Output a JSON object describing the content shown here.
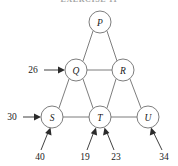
{
  "figure": {
    "caption": "EXERCISE 11",
    "type": "directed-flow-network-diagram"
  },
  "nodes": [
    {
      "id": "P",
      "label": "P",
      "cx": 100,
      "cy": 22,
      "r": 11
    },
    {
      "id": "Q",
      "label": "Q",
      "cx": 76,
      "cy": 70,
      "r": 11
    },
    {
      "id": "R",
      "label": "R",
      "cx": 123,
      "cy": 70,
      "r": 11
    },
    {
      "id": "S",
      "label": "S",
      "cx": 52,
      "cy": 117,
      "r": 11
    },
    {
      "id": "T",
      "label": "T",
      "cx": 100,
      "cy": 117,
      "r": 11
    },
    {
      "id": "U",
      "label": "U",
      "cx": 148,
      "cy": 117,
      "r": 11
    }
  ],
  "edges": [
    {
      "from": "P",
      "to": "Q"
    },
    {
      "from": "P",
      "to": "R"
    },
    {
      "from": "Q",
      "to": "R"
    },
    {
      "from": "Q",
      "to": "S"
    },
    {
      "from": "Q",
      "to": "T"
    },
    {
      "from": "R",
      "to": "T"
    },
    {
      "from": "R",
      "to": "U"
    },
    {
      "from": "S",
      "to": "T"
    },
    {
      "from": "T",
      "to": "U"
    }
  ],
  "inflow_arrows": [
    {
      "id": "in-26",
      "value": "26",
      "target": "Q",
      "direction": "from-left",
      "label_x": 33,
      "label_y": 70,
      "x1": 44,
      "y1": 70,
      "x2": 64,
      "y2": 70
    },
    {
      "id": "in-30",
      "value": "30",
      "target": "S",
      "direction": "from-left",
      "label_x": 12,
      "label_y": 117,
      "x1": 23,
      "y1": 117,
      "x2": 40,
      "y2": 117
    },
    {
      "id": "in-40",
      "value": "40",
      "target": "S",
      "direction": "from-below",
      "label_x": 40,
      "label_y": 157,
      "x1": 42,
      "y1": 150,
      "x2": 50,
      "y2": 130
    },
    {
      "id": "in-19",
      "value": "19",
      "target": "T",
      "direction": "from-below",
      "label_x": 85,
      "label_y": 157,
      "x1": 88,
      "y1": 150,
      "x2": 95,
      "y2": 130
    },
    {
      "id": "in-23",
      "value": "23",
      "target": "T",
      "direction": "from-below",
      "label_x": 116,
      "label_y": 157,
      "x1": 113,
      "y1": 150,
      "x2": 105,
      "y2": 130
    },
    {
      "id": "in-34",
      "value": "34",
      "target": "U",
      "direction": "from-below",
      "label_x": 164,
      "label_y": 157,
      "x1": 161,
      "y1": 150,
      "x2": 152,
      "y2": 130
    }
  ],
  "colors": {
    "node_stroke": "#6e6e6e",
    "node_fill": "#ffffff",
    "edge": "#6e6e6e",
    "arrow": "#2b2b2b",
    "text": "#1a1a1a",
    "background": "#ffffff"
  }
}
